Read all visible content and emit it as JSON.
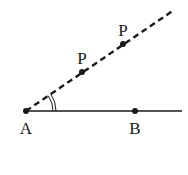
{
  "diagram": {
    "type": "geometry",
    "colors": {
      "line": "#1a1a1a",
      "background": "#ffffff"
    },
    "points": [
      {
        "id": "A",
        "label": "A",
        "x": 26,
        "y": 111,
        "label_x": 26,
        "label_y": 134
      },
      {
        "id": "B",
        "label": "B",
        "x": 135,
        "y": 111,
        "label_x": 135,
        "label_y": 134
      },
      {
        "id": "P1",
        "label": "P",
        "x": 82,
        "y": 72,
        "label_x": 82,
        "label_y": 64
      },
      {
        "id": "P2",
        "label": "P",
        "x": 123,
        "y": 44,
        "label_x": 123,
        "label_y": 36
      }
    ],
    "solid_line": {
      "from": [
        26,
        111
      ],
      "to": [
        182,
        111
      ]
    },
    "dashed_ray": {
      "from": [
        26,
        111
      ],
      "to": [
        174,
        10
      ]
    },
    "angle_mark": {
      "vertex": "A",
      "arcs": 2,
      "radii": [
        27,
        30
      ]
    }
  }
}
